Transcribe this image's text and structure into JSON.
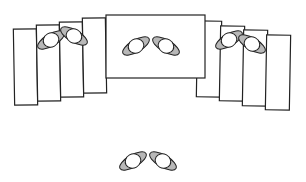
{
  "diagram": {
    "colors": {
      "outline": "#222222",
      "shoulder_fill": "#b8b8b8",
      "head_fill": "#ffffff",
      "background": "#ffffff"
    },
    "desks": [
      {
        "id": "desk-left-1",
        "x": 14,
        "y": 29,
        "w": 23,
        "h": 76,
        "rot": -1
      },
      {
        "id": "desk-left-2",
        "x": 37,
        "y": 25,
        "w": 23,
        "h": 76,
        "rot": -1
      },
      {
        "id": "desk-left-3",
        "x": 60,
        "y": 22,
        "w": 23,
        "h": 75,
        "rot": -1
      },
      {
        "id": "desk-left-4",
        "x": 83,
        "y": 18,
        "w": 23,
        "h": 75,
        "rot": -1
      },
      {
        "id": "desk-right-1",
        "x": 197,
        "y": 21,
        "w": 24,
        "h": 76,
        "rot": 1
      },
      {
        "id": "desk-right-2",
        "x": 220,
        "y": 26,
        "w": 24,
        "h": 75,
        "rot": 1
      },
      {
        "id": "desk-right-3",
        "x": 243,
        "y": 30,
        "w": 24,
        "h": 76,
        "rot": 1
      },
      {
        "id": "desk-right-4",
        "x": 266,
        "y": 35,
        "w": 24,
        "h": 75,
        "rot": 1
      },
      {
        "id": "desk-center",
        "x": 106,
        "y": 15,
        "w": 99,
        "h": 63,
        "rot": 0
      }
    ],
    "persons": [
      {
        "id": "person-left-a",
        "cx": 51,
        "cy": 40,
        "rot": -30
      },
      {
        "id": "person-left-b",
        "cx": 74,
        "cy": 36,
        "rot": 30
      },
      {
        "id": "person-center-a",
        "cx": 136,
        "cy": 46,
        "rot": -30
      },
      {
        "id": "person-center-b",
        "cx": 166,
        "cy": 46,
        "rot": 30
      },
      {
        "id": "person-right-a",
        "cx": 229,
        "cy": 40,
        "rot": -30
      },
      {
        "id": "person-right-b",
        "cx": 252,
        "cy": 44,
        "rot": 30
      },
      {
        "id": "person-front-a",
        "cx": 133,
        "cy": 161,
        "rot": -30
      },
      {
        "id": "person-front-b",
        "cx": 163,
        "cy": 161,
        "rot": 30
      }
    ]
  }
}
